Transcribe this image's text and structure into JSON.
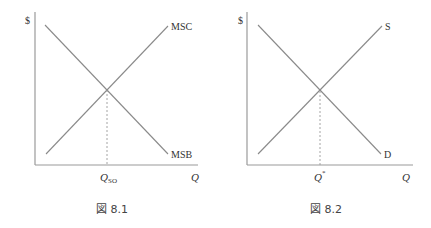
{
  "figures": [
    {
      "caption": "図 8.1",
      "y_axis_label": "$",
      "x_axis_label": "Q",
      "equilibrium_label": "Q",
      "equilibrium_subscript": "SO",
      "upward_curve_label": "MSC",
      "downward_curve_label": "MSB"
    },
    {
      "caption": "図 8.2",
      "y_axis_label": "$",
      "x_axis_label": "Q",
      "equilibrium_label": "Q",
      "equilibrium_superscript": "*",
      "upward_curve_label": "S",
      "downward_curve_label": "D"
    }
  ],
  "colors": {
    "axis": "#9a9a9a",
    "curve": "#8a8a8a",
    "text": "#333333"
  }
}
